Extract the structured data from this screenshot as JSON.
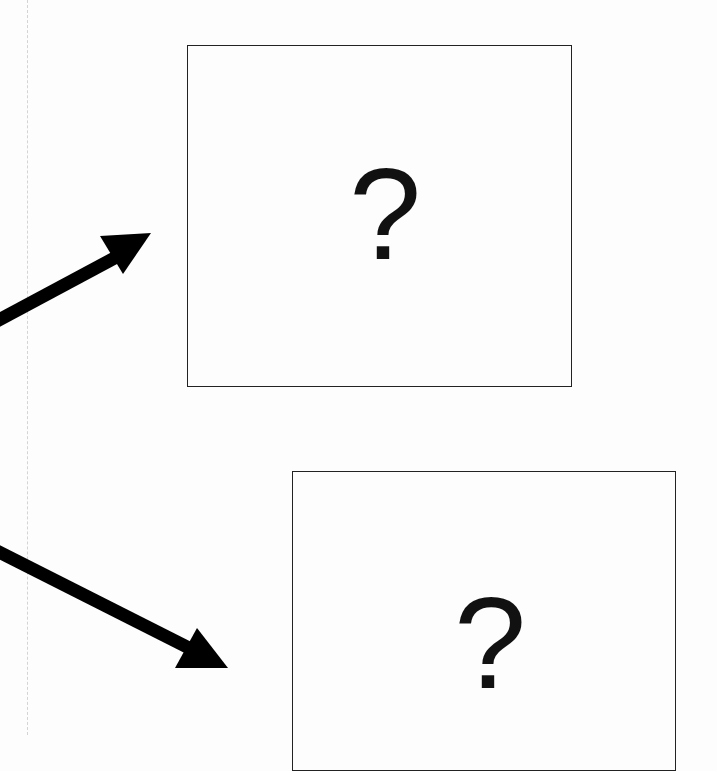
{
  "diagram": {
    "boxes": [
      {
        "id": "top",
        "label": "?"
      },
      {
        "id": "bottom",
        "label": "?"
      }
    ],
    "arrows": [
      {
        "id": "arrow-up-right",
        "target": "top"
      },
      {
        "id": "arrow-down-right",
        "target": "bottom"
      }
    ],
    "colors": {
      "stroke": "#222222",
      "arrow": "#000000",
      "background": "#fdfdfd"
    }
  }
}
